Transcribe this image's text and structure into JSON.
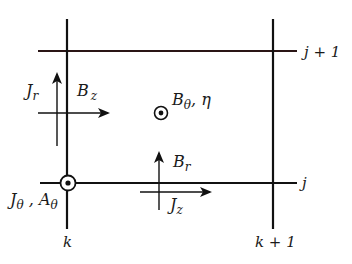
{
  "diagram": {
    "type": "staggered-grid-cell",
    "grid": {
      "rows": [
        {
          "label": "j + 1",
          "y": 51,
          "color": "#2a1a1a"
        },
        {
          "label": "j",
          "y": 183,
          "color": "#1a1a1a"
        }
      ],
      "columns": [
        {
          "label": "k",
          "x": 67
        },
        {
          "label": "k + 1",
          "x": 273
        }
      ]
    },
    "labels": {
      "row_top": "j + 1",
      "row_bottom": "j",
      "col_left": "k",
      "col_right": "k + 1",
      "jr": "J",
      "jr_sub": "r",
      "bz": "B",
      "bz_sub": "z",
      "btheta": "B",
      "btheta_sub": "θ",
      "btheta_rest": ", η",
      "br": "B",
      "br_sub": "r",
      "jz": "J",
      "jz_sub": "z",
      "jtheta": "J",
      "jtheta_sub": "θ",
      "jtheta_sep": " , ",
      "atheta": "A",
      "atheta_sub": "θ"
    },
    "symbols": [
      {
        "name": "out-of-plane-vector",
        "at": "cell-center",
        "quantities": [
          "B_theta",
          "eta"
        ]
      },
      {
        "name": "out-of-plane-vector",
        "at": "node (j,k)",
        "quantities": [
          "J_theta",
          "A_theta"
        ]
      }
    ],
    "arrows": [
      {
        "quantity": "J_r",
        "direction": "up",
        "location": "left edge midpoint"
      },
      {
        "quantity": "B_z",
        "direction": "right",
        "location": "left edge midpoint"
      },
      {
        "quantity": "B_r",
        "direction": "up",
        "location": "bottom edge midpoint"
      },
      {
        "quantity": "J_z",
        "direction": "right",
        "location": "bottom edge midpoint"
      }
    ]
  }
}
